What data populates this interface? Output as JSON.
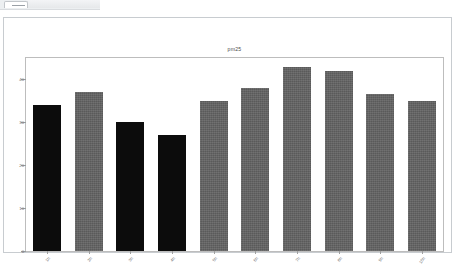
{
  "chrome": {
    "tab_label": "",
    "strip_label": ""
  },
  "chart_data": {
    "type": "bar",
    "title": "pm25",
    "xlabel": "",
    "ylabel": "",
    "categories": [
      "1h",
      "2h",
      "3h",
      "4h",
      "5h",
      "6h",
      "7h",
      "8h",
      "9h",
      "10h"
    ],
    "values": [
      34,
      37,
      30,
      27,
      35,
      38,
      43,
      42,
      36.5,
      35
    ],
    "ylim": [
      0,
      45
    ],
    "yticks": [
      0,
      10,
      20,
      30,
      40
    ],
    "ytick_labels": [
      "0",
      "10",
      "20",
      "30",
      "40"
    ],
    "grid": false,
    "legend": "none",
    "bar_colors": [
      "#0c0c0c",
      "#636363",
      "#0c0c0c",
      "#0c0c0c",
      "#636363",
      "#636363",
      "#636363",
      "#636363",
      "#636363",
      "#636363"
    ],
    "highlight_color": "#0c0c0c",
    "series_color": "#636363",
    "frame_color": "#bdbdbd",
    "tick_color": "#9e9e9e",
    "text_color": "#6b6b6b",
    "background": "#ffffff"
  }
}
